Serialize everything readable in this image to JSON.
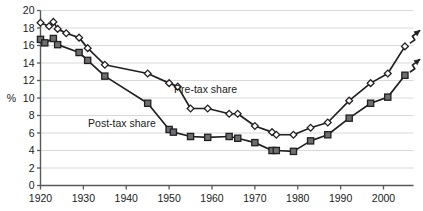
{
  "chart_data": {
    "type": "line",
    "title": "",
    "subtitle": "",
    "xlabel": "",
    "ylabel": "%",
    "xlim": [
      1920,
      2007
    ],
    "ylim": [
      0,
      20
    ],
    "yticks": [
      0,
      2,
      4,
      6,
      8,
      10,
      12,
      14,
      16,
      18,
      20
    ],
    "xticks": [
      1920,
      1930,
      1940,
      1950,
      1960,
      1970,
      1980,
      1990,
      2000
    ],
    "ytick_labels": [
      "0",
      "2",
      "4",
      "6",
      "8",
      "10",
      "12",
      "14",
      "16",
      "18",
      "20"
    ],
    "xtick_labels": [
      "1920",
      "1930",
      "1940",
      "1950",
      "1960",
      "1970",
      "1980",
      "1990",
      "2000"
    ],
    "grid": true,
    "grid_axis": "y",
    "legend": "inline-annotations",
    "annotations": [
      {
        "text": "Pre-tax share",
        "x": 1958.5,
        "y": 10.6,
        "name": "pre-tax-share-label"
      },
      {
        "text": "Post-tax share",
        "x": 1939.0,
        "y": 6.7,
        "name": "post-tax-share-label"
      }
    ],
    "series": [
      {
        "name": "Pre-tax share",
        "marker": "open-diamond",
        "marker_fill": "#ffffff",
        "marker_edge": "#231f20",
        "line_color": "#231f20",
        "points": [
          {
            "x": 1920,
            "y": 18.6
          },
          {
            "x": 1922,
            "y": 18.2
          },
          {
            "x": 1923,
            "y": 18.7
          },
          {
            "x": 1924,
            "y": 17.9
          },
          {
            "x": 1926,
            "y": 17.4
          },
          {
            "x": 1929,
            "y": 16.9
          },
          {
            "x": 1931,
            "y": 15.7
          },
          {
            "x": 1935,
            "y": 13.8
          },
          {
            "x": 1945,
            "y": 12.8
          },
          {
            "x": 1950,
            "y": 11.7
          },
          {
            "x": 1952,
            "y": 11.3
          },
          {
            "x": 1955,
            "y": 8.8
          },
          {
            "x": 1959,
            "y": 8.8
          },
          {
            "x": 1964,
            "y": 8.2
          },
          {
            "x": 1966,
            "y": 8.2
          },
          {
            "x": 1970,
            "y": 6.8
          },
          {
            "x": 1974,
            "y": 6.1
          },
          {
            "x": 1975,
            "y": 5.8
          },
          {
            "x": 1979,
            "y": 5.8
          },
          {
            "x": 1983,
            "y": 6.6
          },
          {
            "x": 1987,
            "y": 7.2
          },
          {
            "x": 1992,
            "y": 9.7
          },
          {
            "x": 1997,
            "y": 11.7
          },
          {
            "x": 2001,
            "y": 12.8
          },
          {
            "x": 2005,
            "y": 15.9
          }
        ],
        "end_arrow": true
      },
      {
        "name": "Post-tax share",
        "marker": "filled-square",
        "marker_fill": "#6d6e71",
        "marker_edge": "#231f20",
        "line_color": "#231f20",
        "points": [
          {
            "x": 1920,
            "y": 16.7
          },
          {
            "x": 1921,
            "y": 16.3
          },
          {
            "x": 1923,
            "y": 16.8
          },
          {
            "x": 1924,
            "y": 16.1
          },
          {
            "x": 1929,
            "y": 15.2
          },
          {
            "x": 1931,
            "y": 14.3
          },
          {
            "x": 1935,
            "y": 12.5
          },
          {
            "x": 1945,
            "y": 9.4
          },
          {
            "x": 1950,
            "y": 6.4
          },
          {
            "x": 1951,
            "y": 6.1
          },
          {
            "x": 1955,
            "y": 5.6
          },
          {
            "x": 1959,
            "y": 5.5
          },
          {
            "x": 1964,
            "y": 5.6
          },
          {
            "x": 1966,
            "y": 5.4
          },
          {
            "x": 1970,
            "y": 4.9
          },
          {
            "x": 1974,
            "y": 4.0
          },
          {
            "x": 1975,
            "y": 4.0
          },
          {
            "x": 1979,
            "y": 3.9
          },
          {
            "x": 1983,
            "y": 5.1
          },
          {
            "x": 1987,
            "y": 5.8
          },
          {
            "x": 1992,
            "y": 7.7
          },
          {
            "x": 1997,
            "y": 9.4
          },
          {
            "x": 2001,
            "y": 10.1
          },
          {
            "x": 2005,
            "y": 12.6
          }
        ],
        "end_arrow": true
      }
    ]
  },
  "axis": {
    "y_axis_title": "%"
  }
}
